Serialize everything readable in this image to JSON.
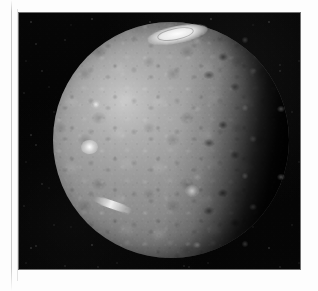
{
  "page": {
    "background_color": "#fdfdfd",
    "width": 318,
    "height": 291
  },
  "photo": {
    "frame": {
      "left": 19,
      "top": 13,
      "width": 281,
      "height": 256,
      "background_color": "#040404",
      "border_color": "#141414"
    },
    "subject": "cratered-moon-disk",
    "phase": "gibbous",
    "illumination_direction": "left",
    "sky_color": "#050505",
    "surface_color": "#8b8b8b",
    "highlight_color": "#ffffff",
    "shadow_color": "#000000"
  },
  "moon": {
    "disk": {
      "left": 53,
      "top": 22,
      "diameter": 236,
      "center_x": 171,
      "center_y": 140
    },
    "features": [
      {
        "name": "bright-ring-crater-top",
        "label": "bright ring-shaped crater at north limb"
      },
      {
        "name": "bright-spot-left",
        "label": "bright spot on western limb"
      },
      {
        "name": "bright-spot-upper-left",
        "label": "small bright spot northwest"
      },
      {
        "name": "bright-streak-lower-left",
        "label": "bright streak near southwest limb"
      },
      {
        "name": "bright-patch-lower-mid",
        "label": "bright patch south-central"
      },
      {
        "name": "terminator-rim",
        "label": "ragged cratered terminator on east limb"
      }
    ]
  },
  "caption": {
    "alt_text": "Black and white spacecraft photograph of a heavily cratered icy moon in gibbous phase against a star-speckled black sky, with a bright ring-like crater at the top limb."
  }
}
